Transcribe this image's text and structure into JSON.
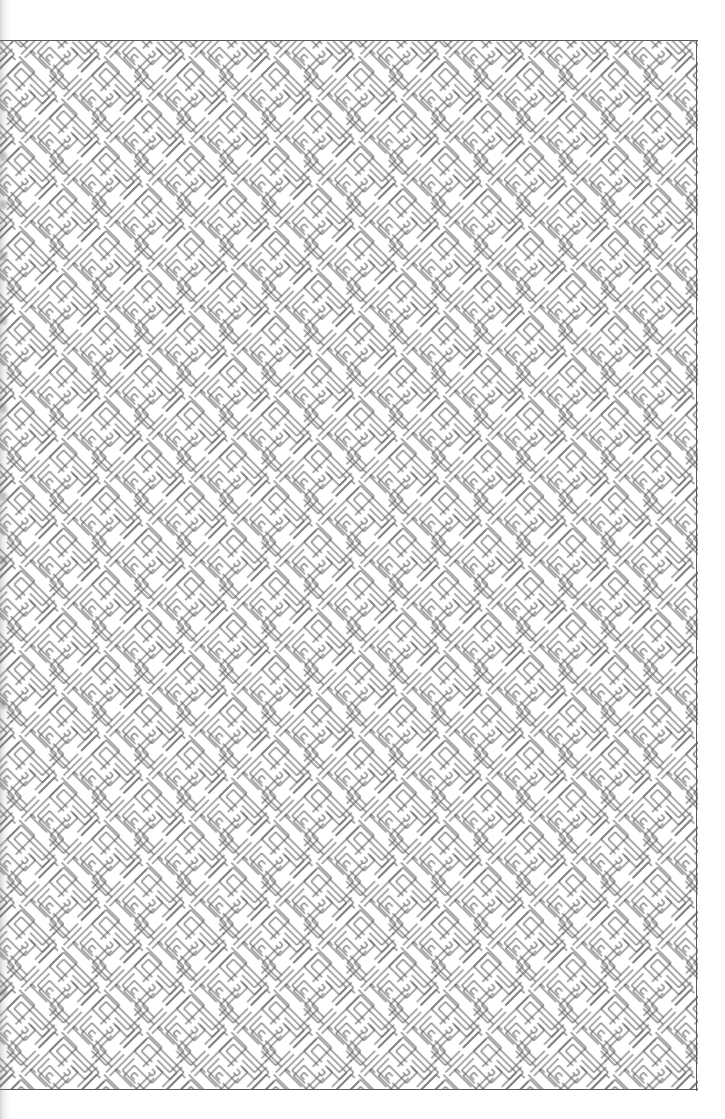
{
  "page": {
    "kind": "scanned-sheet",
    "width": 725,
    "height": 1119,
    "background_color": "#ffffff",
    "caption": ""
  },
  "artwork": {
    "title": "",
    "name": "diagonal-maze-pattern",
    "style": "line art",
    "line_color": "#555555",
    "line_width": 1.0,
    "background_color": "#ffffff",
    "rotation_degrees": 45,
    "cell_size_px": 15,
    "stroke_pair_gap_px": 5,
    "description": "Continuous meander / labyrinth motif of double-stroke L, T and chevron elements tiled on a 45 degree grid"
  },
  "frame": {
    "color": "#5a5a5a",
    "top_rule": "",
    "right_rule": "",
    "bottom_rule": "",
    "left_rule_visible": false,
    "block_left_px": 0,
    "block_top_px": 40,
    "block_right_px": 697,
    "block_bottom_px": 1090
  },
  "scan_artifacts": {
    "gutter_shadow": "",
    "gutter_marks_count": 9,
    "gutter_marks_y": [
      152,
      200,
      252,
      316,
      404,
      492,
      556,
      700,
      988
    ]
  }
}
